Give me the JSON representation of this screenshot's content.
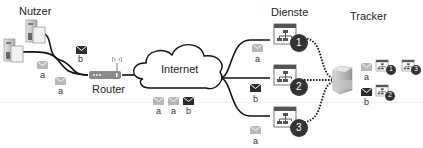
{
  "title_labels": {
    "users": "Nutzer",
    "router": "Router",
    "internet": "Internet",
    "services": "Dienste",
    "tracker": "Tracker"
  },
  "users": [
    {
      "id": "user-1",
      "message_label": "b",
      "message_color": "#2b2b2b"
    },
    {
      "id": "user-2",
      "message_label": "a",
      "message_color": "#b8b8b8"
    }
  ],
  "router_messages": [
    {
      "label": "a",
      "color": "#b8b8b8"
    }
  ],
  "internet_messages": [
    {
      "label": "a",
      "color": "#b8b8b8"
    },
    {
      "label": "a",
      "color": "#b8b8b8"
    },
    {
      "label": "b",
      "color": "#2b2b2b"
    }
  ],
  "services": [
    {
      "number": "1",
      "message_label": "a",
      "message_color": "#b8b8b8"
    },
    {
      "number": "2",
      "message_label": "b",
      "message_color": "#2b2b2b"
    },
    {
      "number": "3",
      "message_label": "a",
      "message_color": "#b8b8b8"
    }
  ],
  "tracker_records": [
    {
      "user": "a",
      "color": "#b8b8b8",
      "services": [
        "1",
        "3"
      ]
    },
    {
      "user": "b",
      "color": "#2b2b2b",
      "services": [
        "2"
      ]
    }
  ],
  "colors": {
    "light_envelope": "#b8b8b8",
    "dark_envelope": "#2b2b2b",
    "badge": "#333333",
    "window_header": "#555555",
    "router": "#8a8a8a"
  }
}
